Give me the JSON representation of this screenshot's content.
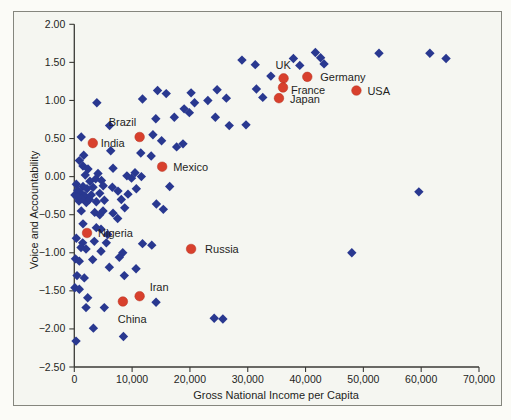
{
  "colors": {
    "page_bg": "#fbfbf7",
    "figure_bg": "#f5f6f1",
    "frame_border": "#85867e",
    "axis": "#3a3a36",
    "text": "#1f1f1d",
    "diamond": "#293890",
    "labeled_dot": "#d8402d"
  },
  "chart_data": {
    "type": "scatter",
    "title": "",
    "xlabel": "Gross National Income per Capita",
    "ylabel": "Voice and Accountability",
    "xlim": [
      0,
      70000
    ],
    "ylim": [
      -2.5,
      2.0
    ],
    "grid": false,
    "legend": null,
    "x_ticks": [
      0,
      10000,
      20000,
      30000,
      40000,
      50000,
      60000,
      70000
    ],
    "x_tick_labels": [
      "0",
      "10,000",
      "20,000",
      "30,000",
      "40,000",
      "50,000",
      "60,000",
      "70,000"
    ],
    "y_ticks": [
      2.0,
      1.5,
      1.0,
      0.5,
      0.0,
      -0.5,
      -1.0,
      -1.5,
      -2.0,
      -2.5
    ],
    "y_tick_labels": [
      "2.00",
      "1.50",
      "1.00",
      "0.50",
      "0.00",
      "−0.50",
      "−1.00",
      "−1.50",
      "−2.00",
      "−2.50"
    ],
    "series": [
      {
        "name": "All countries",
        "marker": "diamond",
        "color": "#293890",
        "points": [
          [
            29000,
            1.53
          ],
          [
            31300,
            1.47
          ],
          [
            34000,
            1.32
          ],
          [
            37900,
            1.55
          ],
          [
            39000,
            1.46
          ],
          [
            41700,
            1.63
          ],
          [
            42600,
            1.56
          ],
          [
            43200,
            1.48
          ],
          [
            52700,
            1.62
          ],
          [
            61500,
            1.62
          ],
          [
            64300,
            1.55
          ],
          [
            31500,
            1.15
          ],
          [
            32600,
            1.04
          ],
          [
            23100,
            1.0
          ],
          [
            24700,
            1.14
          ],
          [
            26300,
            1.03
          ],
          [
            24400,
            0.78
          ],
          [
            26800,
            0.67
          ],
          [
            29700,
            0.68
          ],
          [
            20200,
            1.1
          ],
          [
            20800,
            0.97
          ],
          [
            19000,
            0.89
          ],
          [
            19900,
            0.84
          ],
          [
            17300,
            0.78
          ],
          [
            14100,
            0.76
          ],
          [
            11800,
            1.02
          ],
          [
            14400,
            1.13
          ],
          [
            15900,
            1.09
          ],
          [
            3900,
            0.97
          ],
          [
            6100,
            0.67
          ],
          [
            1200,
            0.52
          ],
          [
            13600,
            0.55
          ],
          [
            15100,
            0.47
          ],
          [
            17700,
            0.39
          ],
          [
            18800,
            0.43
          ],
          [
            6300,
            0.34
          ],
          [
            11500,
            0.31
          ],
          [
            13300,
            0.27
          ],
          [
            870,
            0.21
          ],
          [
            1500,
            0.14
          ],
          [
            6700,
            0.11
          ],
          [
            1630,
            0.28
          ],
          [
            2370,
            0.1
          ],
          [
            4100,
            0.04
          ],
          [
            9100,
            0.01
          ],
          [
            10500,
            0.05
          ],
          [
            11600,
            0.0
          ],
          [
            9900,
            -0.02
          ],
          [
            3700,
            -0.03
          ],
          [
            4700,
            -0.05
          ],
          [
            1900,
            0.02
          ],
          [
            350,
            -0.1
          ],
          [
            1510,
            -0.13
          ],
          [
            2200,
            -0.16
          ],
          [
            3240,
            -0.14
          ],
          [
            6580,
            -0.14
          ],
          [
            1040,
            -0.21
          ],
          [
            100,
            -0.24
          ],
          [
            1800,
            -0.25
          ],
          [
            2940,
            -0.24
          ],
          [
            4400,
            -0.22
          ],
          [
            7560,
            -0.19
          ],
          [
            9290,
            -0.23
          ],
          [
            10730,
            -0.16
          ],
          [
            16500,
            -0.13
          ],
          [
            2700,
            -0.06
          ],
          [
            600,
            -0.18
          ],
          [
            5000,
            -0.12
          ],
          [
            810,
            -0.32
          ],
          [
            2080,
            -0.34
          ],
          [
            3810,
            -0.33
          ],
          [
            8130,
            -0.3
          ],
          [
            1210,
            -0.45
          ],
          [
            4970,
            -0.45
          ],
          [
            8720,
            -0.41
          ],
          [
            14200,
            -0.36
          ],
          [
            15400,
            -0.43
          ],
          [
            3530,
            -0.47
          ],
          [
            4400,
            -0.5
          ],
          [
            6700,
            -0.48
          ],
          [
            1300,
            -0.29
          ],
          [
            2600,
            -0.3
          ],
          [
            500,
            -0.27
          ],
          [
            5200,
            -0.31
          ],
          [
            7500,
            -0.55
          ],
          [
            1510,
            -0.62
          ],
          [
            3810,
            -0.67
          ],
          [
            4620,
            -0.69
          ],
          [
            5780,
            -0.76
          ],
          [
            350,
            -0.81
          ],
          [
            1450,
            -0.87
          ],
          [
            3460,
            -0.85
          ],
          [
            5540,
            -0.87
          ],
          [
            11800,
            -0.88
          ],
          [
            13400,
            -0.9
          ],
          [
            1160,
            -0.93
          ],
          [
            2030,
            -0.95
          ],
          [
            4620,
            -0.98
          ],
          [
            8380,
            -1.0
          ],
          [
            200,
            -1.08
          ],
          [
            870,
            -1.11
          ],
          [
            3180,
            -1.09
          ],
          [
            6060,
            -1.19
          ],
          [
            10680,
            -1.21
          ],
          [
            7790,
            -1.06
          ],
          [
            470,
            -1.3
          ],
          [
            1730,
            -1.33
          ],
          [
            8650,
            -1.3
          ],
          [
            100,
            -1.46
          ],
          [
            870,
            -1.48
          ],
          [
            2320,
            -1.59
          ],
          [
            2030,
            -1.72
          ],
          [
            5190,
            -1.72
          ],
          [
            14140,
            -1.65
          ],
          [
            3300,
            -1.99
          ],
          [
            8500,
            -2.1
          ],
          [
            300,
            -2.16
          ],
          [
            24200,
            -1.86
          ],
          [
            25700,
            -1.87
          ],
          [
            48000,
            -1.0
          ],
          [
            59600,
            -0.2
          ]
        ]
      },
      {
        "name": "Labeled countries",
        "marker": "circle",
        "color": "#d8402d",
        "points": [
          {
            "label": "UK",
            "x": 36200,
            "y": 1.29,
            "dx": -8,
            "dy": -9
          },
          {
            "label": "France",
            "x": 36100,
            "y": 1.17,
            "dx": 8,
            "dy": 6
          },
          {
            "label": "Japan",
            "x": 35400,
            "y": 1.03,
            "dx": 11,
            "dy": 5
          },
          {
            "label": "Germany",
            "x": 40300,
            "y": 1.31,
            "dx": 13,
            "dy": 4
          },
          {
            "label": "USA",
            "x": 48800,
            "y": 1.13,
            "dx": 11,
            "dy": 4
          },
          {
            "label": "Brazil",
            "x": 11300,
            "y": 0.52,
            "dx": -31,
            "dy": -11
          },
          {
            "label": "India",
            "x": 3200,
            "y": 0.44,
            "dx": 8,
            "dy": 4
          },
          {
            "label": "Mexico",
            "x": 15200,
            "y": 0.13,
            "dx": 11,
            "dy": 4
          },
          {
            "label": "Nigeria",
            "x": 2200,
            "y": -0.74,
            "dx": 11,
            "dy": 4
          },
          {
            "label": "Russia",
            "x": 20200,
            "y": -0.95,
            "dx": 14,
            "dy": 4
          },
          {
            "label": "Iran",
            "x": 11300,
            "y": -1.57,
            "dx": 10,
            "dy": -5
          },
          {
            "label": "China",
            "x": 8400,
            "y": -1.64,
            "dx": -5,
            "dy": 21
          }
        ]
      }
    ]
  }
}
